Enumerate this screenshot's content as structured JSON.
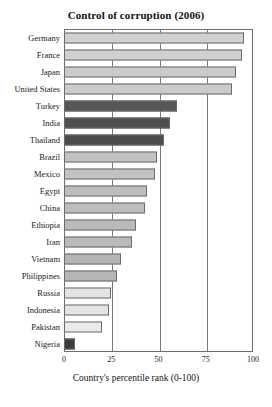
{
  "chart_data": {
    "type": "bar",
    "orientation": "horizontal",
    "title": "Control of corruption (2006)",
    "xlabel": "Country's percentile rank (0-100)",
    "ylabel": "",
    "xlim": [
      0,
      100
    ],
    "xticks": [
      0,
      25,
      50,
      75,
      100
    ],
    "xtick_labels": [
      "0",
      "25",
      "50",
      "75",
      "100"
    ],
    "grid": true,
    "grid_axis": "x",
    "legend": "none",
    "categories": [
      "Germany",
      "France",
      "Japan",
      "United States",
      "Turkey",
      "India",
      "Thailand",
      "Brazil",
      "Mexico",
      "Egypt",
      "China",
      "Ethiopia",
      "Iran",
      "Vietnam",
      "Philippines",
      "Russia",
      "Indonesia",
      "Pakistan",
      "Nigeria"
    ],
    "values": [
      95,
      94,
      91,
      89,
      60,
      56,
      53,
      49,
      48,
      44,
      43,
      38,
      36,
      30,
      28,
      25,
      24,
      20,
      6
    ],
    "bar_colors": [
      "#d0d0d0",
      "#d0d0d0",
      "#cbcbcb",
      "#cbcbcb",
      "#565656",
      "#4f4f4f",
      "#4d4d4d",
      "#c2c2c2",
      "#c2c2c2",
      "#bdbdbd",
      "#bdbdbd",
      "#bababa",
      "#bababa",
      "#b5b5b5",
      "#b5b5b5",
      "#e4e4e4",
      "#e4e4e4",
      "#eaeaea",
      "#3a3a3a"
    ],
    "highlighted": [
      "Turkey",
      "India",
      "Thailand",
      "Nigeria"
    ]
  },
  "colors": {
    "background": "#ffffff",
    "axis": "#6d6d6d",
    "grid": "#7a7a7a",
    "bar_outline": "#6a6a6a",
    "text": "#1a1a1a",
    "highlight_dark": "#4f4f4f",
    "nigeria_dark": "#3a3a3a"
  }
}
